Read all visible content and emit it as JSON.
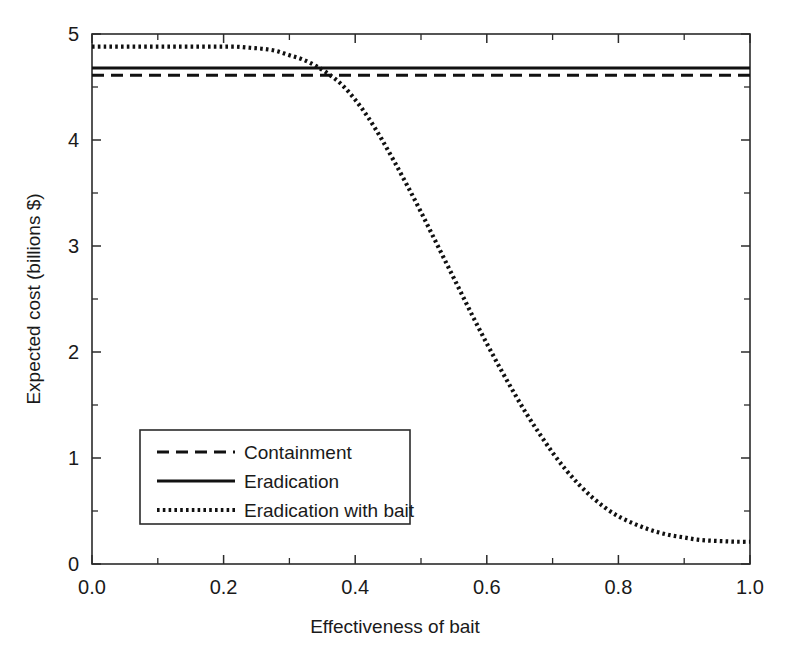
{
  "chart_data": {
    "type": "line",
    "title": "",
    "xlabel": "Effectiveness of bait",
    "ylabel": "Expected cost (billions $)",
    "xlim": [
      0.0,
      1.0
    ],
    "ylim": [
      0.0,
      5.0
    ],
    "grid": false,
    "legend_position": "lower-left-inside",
    "xticks": [
      0.0,
      0.2,
      0.4,
      0.6,
      0.8,
      1.0
    ],
    "xtick_labels": [
      "0.0",
      "0.2",
      "0.4",
      "0.6",
      "0.8",
      "1.0"
    ],
    "xticks_minor": [
      0.1,
      0.3,
      0.5,
      0.7,
      0.9
    ],
    "yticks": [
      0,
      1,
      2,
      3,
      4,
      5
    ],
    "ytick_labels": [
      "0",
      "1",
      "2",
      "3",
      "4",
      "5"
    ],
    "yticks_minor": [
      0.5,
      1.5,
      2.5,
      3.5,
      4.5
    ],
    "x": [
      0.0,
      0.02,
      0.04,
      0.06,
      0.08,
      0.1,
      0.12,
      0.14,
      0.16,
      0.18,
      0.2,
      0.22,
      0.24,
      0.26,
      0.28,
      0.3,
      0.32,
      0.34,
      0.36,
      0.38,
      0.4,
      0.42,
      0.44,
      0.46,
      0.48,
      0.5,
      0.52,
      0.54,
      0.56,
      0.58,
      0.6,
      0.62,
      0.64,
      0.66,
      0.68,
      0.7,
      0.72,
      0.74,
      0.76,
      0.78,
      0.8,
      0.82,
      0.84,
      0.86,
      0.88,
      0.9,
      0.92,
      0.94,
      0.96,
      0.98,
      1.0
    ],
    "series": [
      {
        "name": "Containment",
        "style": "dashed",
        "dash_pattern": "12,7",
        "line_width": 3.0,
        "constant": true,
        "values": [
          4.61,
          4.61,
          4.61,
          4.61,
          4.61,
          4.61,
          4.61,
          4.61,
          4.61,
          4.61,
          4.61,
          4.61,
          4.61,
          4.61,
          4.61,
          4.61,
          4.61,
          4.61,
          4.61,
          4.61,
          4.61,
          4.61,
          4.61,
          4.61,
          4.61,
          4.61,
          4.61,
          4.61,
          4.61,
          4.61,
          4.61,
          4.61,
          4.61,
          4.61,
          4.61,
          4.61,
          4.61,
          4.61,
          4.61,
          4.61,
          4.61,
          4.61,
          4.61,
          4.61,
          4.61,
          4.61,
          4.61,
          4.61,
          4.61,
          4.61,
          4.61
        ]
      },
      {
        "name": "Eradication",
        "style": "solid",
        "dash_pattern": "none",
        "line_width": 3.0,
        "constant": true,
        "values": [
          4.68,
          4.68,
          4.68,
          4.68,
          4.68,
          4.68,
          4.68,
          4.68,
          4.68,
          4.68,
          4.68,
          4.68,
          4.68,
          4.68,
          4.68,
          4.68,
          4.68,
          4.68,
          4.68,
          4.68,
          4.68,
          4.68,
          4.68,
          4.68,
          4.68,
          4.68,
          4.68,
          4.68,
          4.68,
          4.68,
          4.68,
          4.68,
          4.68,
          4.68,
          4.68,
          4.68,
          4.68,
          4.68,
          4.68,
          4.68,
          4.68,
          4.68,
          4.68,
          4.68,
          4.68,
          4.68,
          4.68,
          4.68,
          4.68,
          4.68,
          4.68
        ]
      },
      {
        "name": "Eradication with bait",
        "style": "dotted",
        "dash_pattern": "2.6,3.2",
        "line_width": 4.2,
        "constant": false,
        "values": [
          4.88,
          4.88,
          4.88,
          4.88,
          4.88,
          4.88,
          4.88,
          4.88,
          4.88,
          4.88,
          4.88,
          4.88,
          4.87,
          4.86,
          4.84,
          4.8,
          4.76,
          4.7,
          4.62,
          4.52,
          4.38,
          4.21,
          4.01,
          3.79,
          3.56,
          3.32,
          3.07,
          2.82,
          2.57,
          2.32,
          2.08,
          1.85,
          1.63,
          1.42,
          1.23,
          1.05,
          0.89,
          0.75,
          0.63,
          0.53,
          0.45,
          0.39,
          0.34,
          0.3,
          0.27,
          0.25,
          0.23,
          0.22,
          0.215,
          0.21,
          0.21
        ]
      }
    ]
  },
  "legend": {
    "entries": [
      {
        "label": "Containment"
      },
      {
        "label": "Eradication"
      },
      {
        "label": "Eradication with bait"
      }
    ]
  },
  "colors": {
    "line": "#111111",
    "axis": "#2b2b2b",
    "background": "#ffffff",
    "text": "#1a1a1a"
  }
}
